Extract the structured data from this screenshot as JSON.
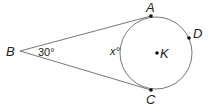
{
  "diagram": {
    "type": "geometry",
    "points": {
      "A": {
        "label": "A"
      },
      "B": {
        "label": "B"
      },
      "C": {
        "label": "C"
      },
      "D": {
        "label": "D"
      },
      "K": {
        "label": "K"
      }
    },
    "angle_B": "30°",
    "arc_label": "x°"
  }
}
